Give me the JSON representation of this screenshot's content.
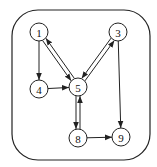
{
  "diagram": {
    "type": "directed-graph",
    "frame": {
      "x": 12,
      "y": 10,
      "width": 138,
      "height": 150,
      "rx": 26
    },
    "nodes": [
      {
        "id": "1",
        "label": "1",
        "x": 39,
        "y": 32
      },
      {
        "id": "3",
        "label": "3",
        "x": 118,
        "y": 32
      },
      {
        "id": "4",
        "label": "4",
        "x": 39,
        "y": 89
      },
      {
        "id": "5",
        "label": "5",
        "x": 78,
        "y": 87
      },
      {
        "id": "8",
        "label": "8",
        "x": 78,
        "y": 138
      },
      {
        "id": "9",
        "label": "9",
        "x": 121,
        "y": 137
      }
    ],
    "edges": [
      {
        "from": "1",
        "to": "4"
      },
      {
        "from": "1",
        "to": "5"
      },
      {
        "from": "5",
        "to": "1"
      },
      {
        "from": "3",
        "to": "5"
      },
      {
        "from": "5",
        "to": "3"
      },
      {
        "from": "4",
        "to": "5"
      },
      {
        "from": "3",
        "to": "9"
      },
      {
        "from": "5",
        "to": "8"
      },
      {
        "from": "8",
        "to": "5"
      },
      {
        "from": "8",
        "to": "9"
      }
    ]
  }
}
